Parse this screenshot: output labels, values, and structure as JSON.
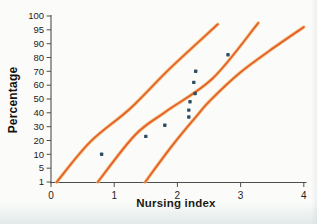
{
  "figure": {
    "x_axis_title": "Nursing index",
    "y_axis_title": "Percentage"
  },
  "chart_data": {
    "type": "scatter",
    "title": "",
    "xlabel": "Nursing index",
    "ylabel": "Percentage",
    "x_ticks": [
      0,
      1,
      2,
      3,
      4
    ],
    "xlim": [
      0,
      4
    ],
    "y_ticks": [
      1,
      5,
      10,
      20,
      30,
      40,
      50,
      60,
      70,
      80,
      90,
      95,
      100
    ],
    "y_scale_note": "probability-plot style: listed percentage ticks evenly spaced",
    "grid": false,
    "legend": null,
    "points": [
      {
        "x": 0.8,
        "percent": 10
      },
      {
        "x": 1.5,
        "percent": 23
      },
      {
        "x": 1.8,
        "percent": 31
      },
      {
        "x": 2.18,
        "percent": 37
      },
      {
        "x": 2.18,
        "percent": 42
      },
      {
        "x": 2.2,
        "percent": 48
      },
      {
        "x": 2.28,
        "percent": 54
      },
      {
        "x": 2.26,
        "percent": 62
      },
      {
        "x": 2.29,
        "percent": 70
      },
      {
        "x": 2.8,
        "percent": 82
      }
    ],
    "curves": [
      {
        "name": "lower-confidence-band",
        "samples": [
          [
            0.09,
            1
          ],
          [
            0.62,
            19
          ],
          [
            1.25,
            43
          ],
          [
            1.88,
            72
          ],
          [
            2.64,
            97
          ]
        ]
      },
      {
        "name": "fitted-line",
        "samples": [
          [
            0.74,
            1
          ],
          [
            1.33,
            24
          ],
          [
            1.82,
            41
          ],
          [
            2.56,
            65
          ],
          [
            3.28,
            97.5
          ]
        ]
      },
      {
        "name": "upper-confidence-band",
        "samples": [
          [
            1.49,
            1
          ],
          [
            1.93,
            17
          ],
          [
            2.31,
            38
          ],
          [
            2.52,
            49
          ],
          [
            2.99,
            69
          ],
          [
            3.46,
            85
          ],
          [
            4.0,
            96
          ]
        ]
      }
    ],
    "colors": {
      "curve": "#e4632b",
      "curve_halo": "#f5be78",
      "point": "#2e4f63",
      "axis": "#4f4f4f",
      "tick_text": "#26221f",
      "title_text": "#14110e"
    }
  }
}
